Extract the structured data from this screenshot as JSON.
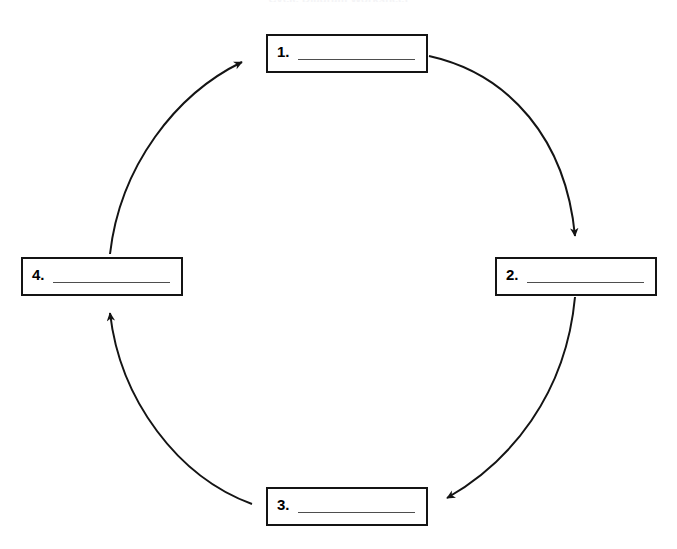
{
  "page": {
    "title": "Cycle Diagram Worksheet",
    "background_color": "#ffffff",
    "line_color": "#141414",
    "writeline_color": "#4e4e4e"
  },
  "diagram": {
    "type": "cycle",
    "direction": "clockwise",
    "steps": [
      {
        "number": "1.",
        "value": "",
        "position": "top"
      },
      {
        "number": "2.",
        "value": "",
        "position": "right"
      },
      {
        "number": "3.",
        "value": "",
        "position": "bottom"
      },
      {
        "number": "4.",
        "value": "",
        "position": "left"
      }
    ],
    "connectors": [
      {
        "from": "1",
        "to": "2",
        "shape": "arc",
        "arrowhead": "down"
      },
      {
        "from": "2",
        "to": "3",
        "shape": "arc",
        "arrowhead": "left"
      },
      {
        "from": "3",
        "to": "4",
        "shape": "arc",
        "arrowhead": "up"
      },
      {
        "from": "4",
        "to": "1",
        "shape": "arc",
        "arrowhead": "up-right"
      }
    ]
  }
}
